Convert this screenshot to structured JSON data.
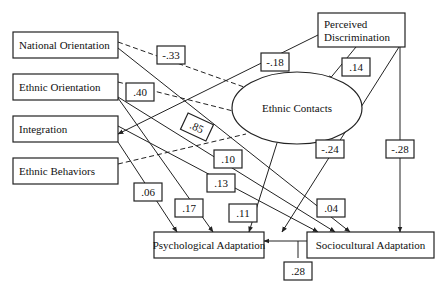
{
  "diagram": {
    "title": "",
    "nodes": [
      {
        "id": "national_orientation",
        "label": "National Orientation",
        "shape": "rect"
      },
      {
        "id": "ethnic_orientation",
        "label": "Ethnic Orientation",
        "shape": "rect"
      },
      {
        "id": "integration",
        "label": "Integration",
        "shape": "rect"
      },
      {
        "id": "ethnic_behaviors",
        "label": "Ethnic Behaviors",
        "shape": "rect"
      },
      {
        "id": "perceived_discrimination",
        "label": "Perceived Discrimination",
        "label_lines": [
          "Perceived",
          "Discrimination"
        ],
        "shape": "rect"
      },
      {
        "id": "ethnic_contacts",
        "label": "Ethnic Contacts",
        "shape": "ellipse"
      },
      {
        "id": "psychological_adaptation",
        "label": "Psychological Adaptation",
        "shape": "rect"
      },
      {
        "id": "sociocultural_adaptation",
        "label": "Sociocultural Adaptation",
        "shape": "rect"
      }
    ],
    "edges": [
      {
        "from": "national_orientation",
        "to": "ethnic_contacts",
        "coef": "-.33",
        "style": "dashed"
      },
      {
        "from": "ethnic_orientation",
        "to": "ethnic_contacts",
        "coef": ".40",
        "style": "dashed"
      },
      {
        "from": "ethnic_behaviors",
        "to": "ethnic_contacts",
        "coef": ".85",
        "style": "dashed"
      },
      {
        "from": "perceived_discrimination",
        "to": "integration",
        "coef": "-.18",
        "style": "solid"
      },
      {
        "from": "perceived_discrimination",
        "to": "ethnic_contacts",
        "coef": ".14",
        "style": "solid"
      },
      {
        "from": "perceived_discrimination",
        "to": "psychological_adaptation",
        "coef": "-.24",
        "style": "solid"
      },
      {
        "from": "perceived_discrimination",
        "to": "sociocultural_adaptation",
        "coef": "-.28",
        "style": "solid"
      },
      {
        "from": "national_orientation",
        "to": "sociocultural_adaptation",
        "coef": ".04",
        "style": "solid"
      },
      {
        "from": "ethnic_orientation",
        "to": "sociocultural_adaptation",
        "coef": ".10",
        "style": "solid"
      },
      {
        "from": "integration",
        "to": "sociocultural_adaptation",
        "coef": ".13",
        "style": "solid"
      },
      {
        "from": "integration",
        "to": "psychological_adaptation",
        "coef": ".06",
        "style": "solid"
      },
      {
        "from": "ethnic_orientation",
        "to": "psychological_adaptation",
        "coef": ".17",
        "style": "solid"
      },
      {
        "from": "ethnic_contacts",
        "to": "psychological_adaptation",
        "coef": ".11",
        "style": "solid"
      },
      {
        "from": "sociocultural_adaptation",
        "to": "psychological_adaptation",
        "coef": ".28",
        "style": "solid"
      }
    ]
  }
}
